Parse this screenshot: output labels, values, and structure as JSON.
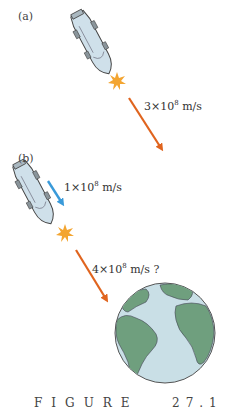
{
  "figure": {
    "panels": [
      {
        "label": "(a)",
        "speed_mantissa": "3",
        "speed_times": "×10",
        "speed_exp": "8",
        "speed_unit": " m/s",
        "arrow_color": "#e0641e"
      },
      {
        "label": "(b)",
        "ship_speed_mantissa": "1",
        "ship_speed_times": "×10",
        "ship_speed_exp": "8",
        "ship_speed_unit": " m/s",
        "ship_arrow_color": "#3a9ad9",
        "light_speed_mantissa": "4",
        "light_speed_times": "×10",
        "light_speed_exp": "8",
        "light_speed_unit": " m/s ?",
        "arrow_color": "#e0641e"
      }
    ],
    "caption_word": "FIGURE",
    "caption_number": "27.1",
    "colors": {
      "ship_fill": "#cfe0ea",
      "ship_outline": "#444444",
      "flash": "#f3a531",
      "ocean": "#c9dfe6",
      "land": "#6f9f7e"
    }
  }
}
